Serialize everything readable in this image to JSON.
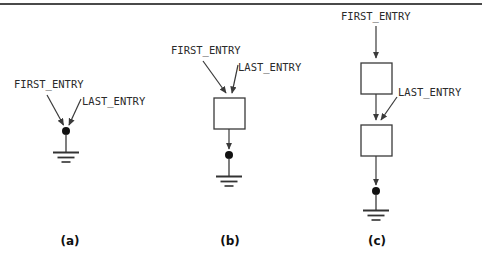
{
  "figure": {
    "background_color": "#ffffff",
    "line_color": "#4a4a4a",
    "text_color": "#2b2b2b",
    "caption_color": "#111111"
  },
  "panels": [
    {
      "id": "a",
      "caption": "(a)",
      "caption_x": 70,
      "caption_y": 234,
      "labels": [
        {
          "name": "first-entry-label",
          "text": "FIRST_ENTRY",
          "x": 14,
          "y": 78
        },
        {
          "name": "last-entry-label",
          "text": "LAST_ENTRY",
          "x": 82,
          "y": 95
        }
      ],
      "boxes": [],
      "dots": [
        {
          "x": 66,
          "y": 131,
          "r": 4
        }
      ],
      "ground": {
        "x": 66,
        "y": 152,
        "widths": [
          26,
          17,
          9
        ],
        "spacing": 5
      }
    },
    {
      "id": "b",
      "caption": "(b)",
      "caption_x": 230,
      "caption_y": 234,
      "labels": [
        {
          "name": "first-entry-label",
          "text": "FIRST_ENTRY",
          "x": 171,
          "y": 44
        },
        {
          "name": "last-entry-label",
          "text": "LAST_ENTRY",
          "x": 238,
          "y": 61
        }
      ],
      "boxes": [
        {
          "x": 214,
          "y": 98,
          "w": 31,
          "h": 31
        }
      ],
      "dots": [
        {
          "x": 229,
          "y": 155,
          "r": 4
        }
      ],
      "ground": {
        "x": 229,
        "y": 176,
        "widths": [
          26,
          17,
          9
        ],
        "spacing": 5
      }
    },
    {
      "id": "c",
      "caption": "(c)",
      "caption_x": 377,
      "caption_y": 234,
      "labels": [
        {
          "name": "first-entry-label",
          "text": "FIRST_ENTRY",
          "x": 341,
          "y": 10
        },
        {
          "name": "last-entry-label",
          "text": "LAST_ENTRY",
          "x": 398,
          "y": 86
        }
      ],
      "boxes": [
        {
          "x": 361,
          "y": 63,
          "w": 31,
          "h": 31
        },
        {
          "x": 361,
          "y": 125,
          "w": 31,
          "h": 31
        }
      ],
      "dots": [
        {
          "x": 376,
          "y": 191,
          "r": 4
        }
      ],
      "ground": {
        "x": 376,
        "y": 210,
        "widths": [
          26,
          17,
          9
        ],
        "spacing": 5
      }
    }
  ]
}
